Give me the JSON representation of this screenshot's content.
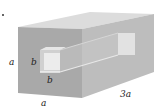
{
  "figure": {
    "labels": {
      "height": "a",
      "width": "a",
      "length": "3a",
      "hole_height": "b",
      "hole_width": "b"
    },
    "colors": {
      "front_face": "#a9a9a9",
      "top_face": "#dcdcdc",
      "right_face": "#bdbdbd",
      "hole_inner_top": "#e6e6e6",
      "hole_inner_side": "#cfcfcf",
      "hole_back": "#ececec"
    }
  }
}
